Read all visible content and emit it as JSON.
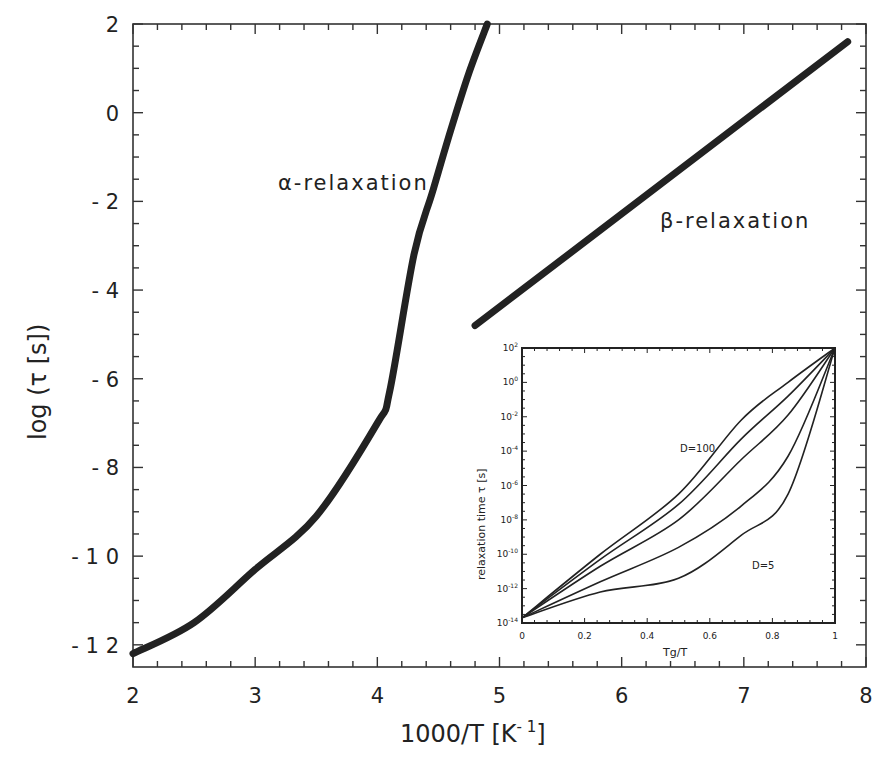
{
  "chart_data": {
    "type": "line",
    "title": "",
    "xlabel": "1000/T [K⁻¹]",
    "ylabel": "log (τ [s])",
    "xlim": [
      2,
      8
    ],
    "ylim": [
      -12.5,
      2
    ],
    "xticks": [
      2,
      3,
      4,
      5,
      6,
      7,
      8
    ],
    "xtick_labels": [
      "2",
      "3",
      "4",
      "5",
      "6",
      "7",
      "8"
    ],
    "yticks": [
      2,
      0,
      -2,
      -4,
      -6,
      -8,
      -10,
      -12
    ],
    "ytick_labels": [
      "2",
      "0",
      "- 2",
      "- 4",
      "- 6",
      "- 8",
      "- 1 0",
      "- 1 2"
    ],
    "grid": false,
    "legend": null,
    "series": [
      {
        "name": "α-relaxation",
        "x": [
          2.0,
          2.5,
          3.0,
          3.5,
          4.0,
          4.1,
          4.3,
          4.45,
          4.6,
          4.75,
          4.9
        ],
        "y": [
          -12.2,
          -11.5,
          -10.3,
          -9.1,
          -7.0,
          -6.3,
          -3.2,
          -1.8,
          -0.4,
          0.9,
          2.0
        ]
      },
      {
        "name": "β-relaxation",
        "x": [
          4.8,
          7.85
        ],
        "y": [
          -4.8,
          1.6
        ]
      }
    ],
    "annotations": [
      {
        "text": "α-relaxation",
        "x": 3.2,
        "y": -1.6
      },
      {
        "text": "β-relaxation",
        "x": 6.3,
        "y": -2.4
      }
    ],
    "inset": {
      "type": "line",
      "xlabel": "Tg/T",
      "ylabel": "relaxation time τ [s]",
      "xlim": [
        0,
        1
      ],
      "ylim_log10": [
        -14,
        2
      ],
      "yscale": "log",
      "xticks": [
        0,
        0.2,
        0.4,
        0.6,
        0.8,
        1
      ],
      "xtick_labels": [
        "0",
        "0.2",
        "0.4",
        "0.6",
        "0.8",
        "1"
      ],
      "yticks_log10": [
        2,
        0,
        -2,
        -4,
        -6,
        -8,
        -10,
        -12,
        -14
      ],
      "ytick_labels": [
        "10^2",
        "10^0",
        "10^-2",
        "10^-4",
        "10^-6",
        "10^-8",
        "10^-10",
        "10^-12",
        "10^-14"
      ],
      "annotations": [
        {
          "text": "D=100",
          "x": 0.6,
          "y_log10": -4.6
        },
        {
          "text": "D=5",
          "x": 0.8,
          "y_log10": -11.5
        }
      ],
      "series": [
        {
          "name": "D=100",
          "x": [
            0,
            0.25,
            0.5,
            0.7,
            0.85,
            1.0
          ],
          "y_log10": [
            -13.7,
            -10.0,
            -6.5,
            -2.2,
            0.0,
            2.0
          ]
        },
        {
          "name": "D=50",
          "x": [
            0,
            0.25,
            0.5,
            0.7,
            0.85,
            1.0
          ],
          "y_log10": [
            -13.7,
            -10.3,
            -7.1,
            -3.3,
            -0.8,
            2.0
          ]
        },
        {
          "name": "D=25",
          "x": [
            0,
            0.25,
            0.5,
            0.7,
            0.85,
            1.0
          ],
          "y_log10": [
            -13.7,
            -10.7,
            -8.0,
            -4.5,
            -1.9,
            2.0
          ]
        },
        {
          "name": "D=10",
          "x": [
            0,
            0.25,
            0.5,
            0.7,
            0.85,
            1.0
          ],
          "y_log10": [
            -13.7,
            -11.6,
            -9.6,
            -7.2,
            -4.3,
            2.0
          ]
        },
        {
          "name": "D=5",
          "x": [
            0,
            0.25,
            0.5,
            0.7,
            0.85,
            1.0
          ],
          "y_log10": [
            -13.7,
            -12.2,
            -11.4,
            -8.9,
            -6.5,
            2.0
          ]
        }
      ]
    }
  },
  "labels": {
    "xlabel_main": "1000/T  [K",
    "xlabel_sup": "- 1",
    "xlabel_close": "]",
    "ylabel": "log  (τ  [s])",
    "alpha": "α-relaxation",
    "beta": "β-relaxation",
    "inset_xlabel": "Tg/T",
    "inset_ylabel": "relaxation time τ [s]",
    "inset_d100": "D=100",
    "inset_d5": "D=5"
  }
}
